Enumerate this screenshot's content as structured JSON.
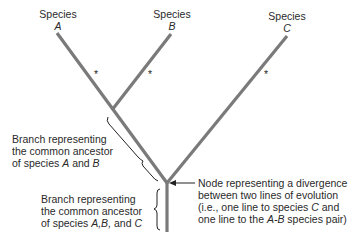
{
  "species": [
    {
      "label": "Species",
      "letter": "A"
    },
    {
      "label": "Species",
      "letter": "B"
    },
    {
      "label": "Species",
      "letter": "C"
    }
  ],
  "marks": {
    "asterisk": "*"
  },
  "annotations": {
    "branch_ab": {
      "line1": "Branch representing",
      "line2": "the common ancestor",
      "line3_pre": "of species ",
      "a": "A",
      "and": " and ",
      "b": "B"
    },
    "branch_abc": {
      "line1": "Branch representing",
      "line2": "the common ancestor",
      "line3_pre": "of species ",
      "abc": "A,B,",
      "and": " and ",
      "c": "C"
    },
    "node": {
      "line1": "Node representing a divergence",
      "line2": "between two lines of evolution",
      "line3_pre": "(i.e., one line to species ",
      "c": "C",
      "line3_post": " and",
      "line4_pre": "one line to the ",
      "ab": "A-B",
      "line4_post": " species pair)"
    }
  },
  "colors": {
    "branch": "#7a7a7a",
    "text": "#2a2a2a"
  }
}
